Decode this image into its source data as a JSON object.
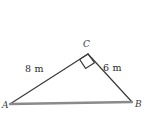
{
  "figure": {
    "type": "right-triangle-geometry-diagram",
    "background_color": "#ffffff",
    "stroke_color": "#3a3a3a",
    "base_stroke_color": "#8a8a8a",
    "vertices": [
      {
        "id": "A",
        "label": "A",
        "x": 10,
        "y": 104,
        "position": "bottom-left"
      },
      {
        "id": "B",
        "label": "B",
        "x": 132,
        "y": 102,
        "position": "bottom-right"
      },
      {
        "id": "C",
        "label": "C",
        "x": 88,
        "y": 54,
        "position": "top"
      }
    ],
    "sides": [
      {
        "id": "AC",
        "label": "8 m",
        "value": 8,
        "unit": "m",
        "from": "A",
        "to": "C"
      },
      {
        "id": "CB",
        "label": "6 m",
        "value": 6,
        "unit": "m",
        "from": "C",
        "to": "B"
      },
      {
        "id": "AB",
        "label": "",
        "value": null,
        "unit": "m",
        "from": "A",
        "to": "B"
      }
    ],
    "right_angle": {
      "at_vertex": "C",
      "marker": "square",
      "size": 10
    }
  }
}
